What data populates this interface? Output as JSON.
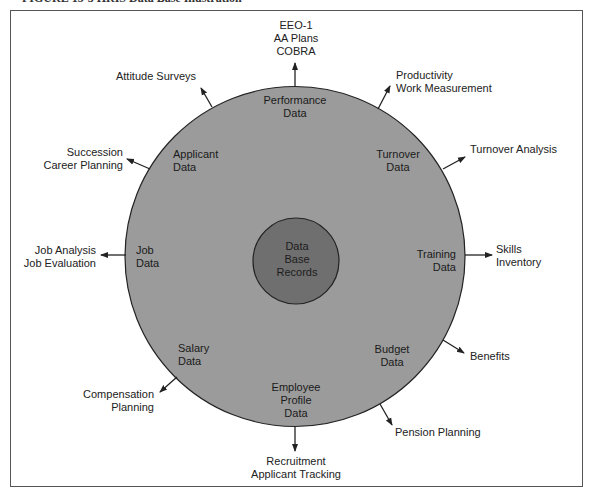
{
  "caption": "FIGURE 15-3 HRIS Data Base Illustration",
  "colors": {
    "outer_circle": "#9b9b9b",
    "inner_circle": "#6f6f6f",
    "stroke": "#222222"
  },
  "center": {
    "label_lines": [
      "Data",
      "Base",
      "Records"
    ]
  },
  "segments": [
    {
      "id": "performance",
      "inner": [
        "Performance",
        "Data"
      ],
      "outer": [
        "EEO-1",
        "AA Plans",
        "COBRA"
      ]
    },
    {
      "id": "productivity",
      "inner": [],
      "outer": [
        "Productivity",
        "Work Measurement"
      ]
    },
    {
      "id": "turnover",
      "inner": [
        "Turnover",
        "Data"
      ],
      "outer": [
        "Turnover Analysis"
      ]
    },
    {
      "id": "training",
      "inner": [
        "Training",
        "Data"
      ],
      "outer": [
        "Skills",
        "Inventory"
      ]
    },
    {
      "id": "budget",
      "inner": [
        "Budget",
        "Data"
      ],
      "outer": [
        "Benefits"
      ]
    },
    {
      "id": "pension",
      "inner": [],
      "outer": [
        "Pension Planning"
      ]
    },
    {
      "id": "employee",
      "inner": [
        "Employee",
        "Profile",
        "Data"
      ],
      "outer": [
        "Recruitment",
        "Applicant Tracking"
      ]
    },
    {
      "id": "salary",
      "inner": [
        "Salary",
        "Data"
      ],
      "outer": [
        "Compensation",
        "Planning"
      ]
    },
    {
      "id": "job",
      "inner": [
        "Job",
        "Data"
      ],
      "outer": [
        "Job Analysis",
        "Job Evaluation"
      ]
    },
    {
      "id": "applicant",
      "inner": [
        "Applicant",
        "Data"
      ],
      "outer": [
        "Succession",
        "Career Planning"
      ]
    },
    {
      "id": "attitude",
      "inner": [],
      "outer": [
        "Attitude Surveys"
      ]
    }
  ]
}
